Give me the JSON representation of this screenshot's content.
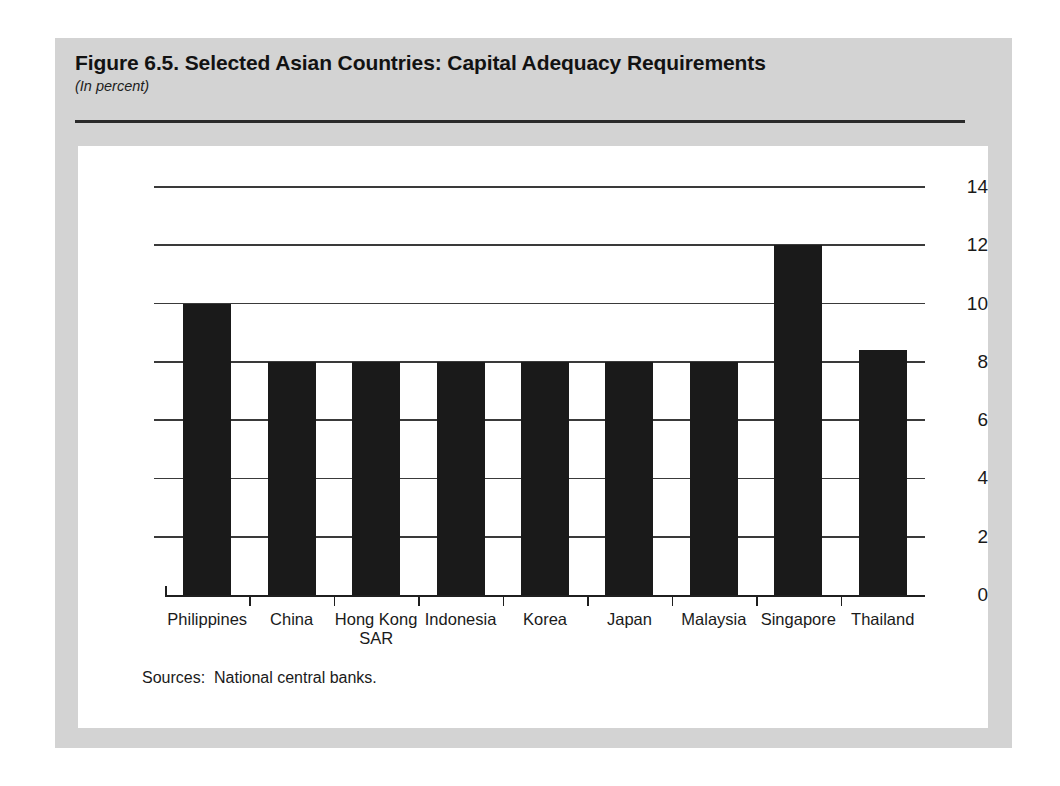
{
  "figure": {
    "title": "Figure 6.5.  Selected Asian Countries: Capital Adequacy Requirements",
    "subtitle": "(In percent)",
    "source_note": "Sources:  National central banks."
  },
  "colors": {
    "paper": "#d3d3d3",
    "panel": "#ffffff",
    "bar": "#1a1a1a",
    "grid": "#3a3a3a",
    "text": "#1a1a1a"
  },
  "chart_data": {
    "type": "bar",
    "title": "Figure 6.5.  Selected Asian Countries: Capital Adequacy Requirements",
    "subtitle": "(In percent)",
    "xlabel": "",
    "ylabel": "",
    "ylim": [
      0,
      14
    ],
    "yticks": [
      0,
      2,
      4,
      6,
      8,
      10,
      12,
      14
    ],
    "ytick_labels": [
      "0",
      "2",
      "4",
      "6",
      "8",
      "10",
      "12",
      "14"
    ],
    "grid": true,
    "legend": false,
    "categories": [
      "Philippines",
      "China",
      "Hong Kong SAR",
      "Indonesia",
      "Korea",
      "Japan",
      "Malaysia",
      "Singapore",
      "Thailand"
    ],
    "category_labels": [
      [
        "Philippines"
      ],
      [
        "China"
      ],
      [
        "Hong Kong",
        "SAR"
      ],
      [
        "Indonesia"
      ],
      [
        "Korea"
      ],
      [
        "Japan"
      ],
      [
        "Malaysia"
      ],
      [
        "Singapore"
      ],
      [
        "Thailand"
      ]
    ],
    "values": [
      10,
      8,
      8,
      8,
      8,
      8,
      8,
      12,
      8.4
    ],
    "source": "Sources:  National central banks."
  }
}
